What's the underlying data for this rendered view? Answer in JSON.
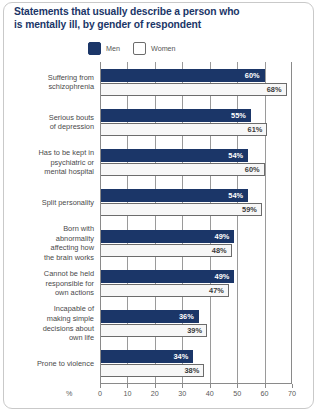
{
  "title": {
    "line1": "Statements that usually describe a person who",
    "line2": "is mentally ill, by gender of respondent"
  },
  "legend": {
    "position": "top-center",
    "items": [
      {
        "label": "Men",
        "color": "#1b3668",
        "key": "men"
      },
      {
        "label": "Women",
        "color": "#ffffff",
        "key": "women"
      }
    ]
  },
  "axis": {
    "percent_symbol": "%",
    "ticks": [
      "0",
      "10",
      "20",
      "30",
      "40",
      "50",
      "60",
      "70"
    ]
  },
  "chart_data": {
    "type": "bar",
    "orientation": "horizontal",
    "title": "Statements that usually describe a person who is mentally ill, by gender of respondent",
    "xlabel": "%",
    "ylabel": "",
    "xlim": [
      0,
      70
    ],
    "xticks": [
      0,
      10,
      20,
      30,
      40,
      50,
      60,
      70
    ],
    "grid": true,
    "legend_position": "top-center",
    "categories": [
      "Suffering from schizophrenia",
      "Serious bouts of depression",
      "Has to be kept in psychiatric or mental hospital",
      "Split personality",
      "Born with abnormality affecting how the brain works",
      "Cannot be held responsible for own actions",
      "Incapable of making simple decisions about own life",
      "Prone to violence"
    ],
    "category_lines": [
      [
        "Suffering from",
        "schizophrenia"
      ],
      [
        "Serious bouts",
        "of depression"
      ],
      [
        "Has to be kept in",
        "psychiatric or",
        "mental hospital"
      ],
      [
        "Split personality"
      ],
      [
        "Born with",
        "abnormality",
        "affecting how",
        "the brain works"
      ],
      [
        "Cannot be held",
        "responsible for",
        "own actions"
      ],
      [
        "Incapable of",
        "making simple",
        "decisions about",
        "own life"
      ],
      [
        "Prone to violence"
      ]
    ],
    "series": [
      {
        "name": "Men",
        "color": "#1b3668",
        "values": [
          60,
          55,
          54,
          54,
          49,
          49,
          36,
          34
        ],
        "labels": [
          "60%",
          "55%",
          "54%",
          "54%",
          "49%",
          "49%",
          "36%",
          "34%"
        ]
      },
      {
        "name": "Women",
        "color": "#ffffff",
        "values": [
          68,
          61,
          60,
          59,
          48,
          47,
          39,
          38
        ],
        "labels": [
          "68%",
          "61%",
          "60%",
          "59%",
          "48%",
          "47%",
          "39%",
          "38%"
        ]
      }
    ]
  }
}
